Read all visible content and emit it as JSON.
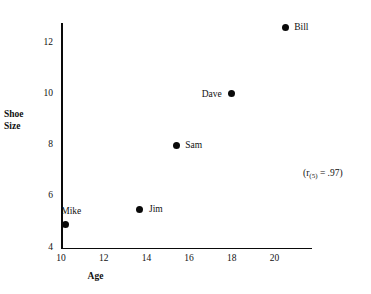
{
  "chart_data": {
    "type": "scatter",
    "title": "",
    "xlabel": "Age",
    "ylabel": "Shoe Size",
    "ylabel_lines": [
      "Shoe",
      "Size"
    ],
    "xlim": [
      10,
      21.7
    ],
    "ylim": [
      4,
      12.8
    ],
    "xticks": [
      "10",
      "12",
      "14",
      "16",
      "18",
      "20"
    ],
    "xtick_values": [
      10,
      12,
      14,
      16,
      18,
      20
    ],
    "yticks": [
      "12",
      "10",
      "8",
      "6",
      "4"
    ],
    "ytick_values": [
      12,
      10,
      8,
      6,
      4
    ],
    "grid": false,
    "legend": "none",
    "points": [
      {
        "label": "Mike",
        "x": 10.2,
        "y": 4.9,
        "label_pos": "above"
      },
      {
        "label": "Jim",
        "x": 13.7,
        "y": 5.5,
        "label_pos": "right"
      },
      {
        "label": "Sam",
        "x": 15.4,
        "y": 8.0,
        "label_pos": "right"
      },
      {
        "label": "Dave",
        "x": 18.0,
        "y": 10.0,
        "label_pos": "left"
      },
      {
        "label": "Bill",
        "x": 20.5,
        "y": 12.6,
        "label_pos": "right"
      }
    ],
    "annotations": [
      {
        "text": "(r(5) = .97)",
        "prefix": "(r",
        "subscript": "(5)",
        "suffix": " = .97)",
        "x": 303,
        "y": 168
      }
    ]
  }
}
